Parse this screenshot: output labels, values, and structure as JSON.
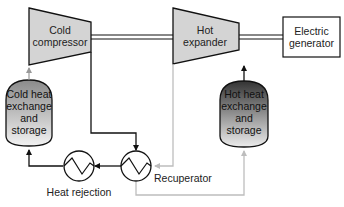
{
  "components": {
    "cold_compressor": {
      "line1": "Cold",
      "line2": "compressor"
    },
    "hot_expander": {
      "line1": "Hot",
      "line2": "expander"
    },
    "electric_generator": {
      "line1": "Electric",
      "line2": "generator"
    },
    "cold_storage": {
      "line1": "Cold heat",
      "line2": "exchange",
      "line3": "and",
      "line4": "storage"
    },
    "hot_storage": {
      "line1": "Hot heat",
      "line2": "exchange",
      "line3": "and",
      "line4": "storage"
    },
    "heat_rejection": {
      "label": "Heat rejection"
    },
    "recuperator": {
      "label": "Recuperator"
    }
  },
  "colors": {
    "machine_fill": "#d4d4d4",
    "stroke": "#111111",
    "hot_flow": "#bdbdbd",
    "cold_tank_top": "#8a8a8a",
    "cold_tank_bottom": "#f2f2f2",
    "hot_tank_top": "#3a3a3a",
    "hot_tank_bottom": "#e6e6e6"
  }
}
